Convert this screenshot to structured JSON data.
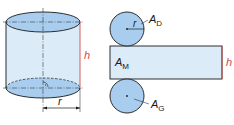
{
  "diagram": {
    "type": "cylinder-net",
    "colors": {
      "fill_light": "#dcebf8",
      "fill_cap": "#a9cdee",
      "stroke": "#1a1a1a",
      "height_marker": "#d04a4a",
      "dashdot": "#3a3a3a"
    },
    "cylinder": {
      "height_label": "h",
      "radius_label": "r"
    },
    "net": {
      "top_circle": {
        "radius_label": "r",
        "area_label": "A",
        "area_sub": "D"
      },
      "lateral": {
        "area_label": "A",
        "area_sub": "M",
        "height_label": "h"
      },
      "bottom_circle": {
        "area_label": "A",
        "area_sub": "G"
      }
    }
  }
}
